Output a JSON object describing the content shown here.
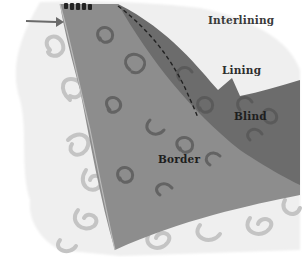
{
  "diagram": {
    "labels": {
      "interlining": "Interlining",
      "lining": "Lining",
      "blind": "Blind",
      "border": "Border"
    },
    "colors": {
      "background": "#ffffff",
      "interlining": "#e8e8e8",
      "lining_fabric": "#6f6f6f",
      "border_fabric": "#8a8a8a",
      "motif_light": "#bdbdbd",
      "motif_dark": "#4a4a4a",
      "stitch_line": "#222222",
      "arrow": "#666666"
    },
    "icons": {
      "pointer": "arrow-right-icon",
      "stitching": "dashed-stitch-line"
    }
  }
}
